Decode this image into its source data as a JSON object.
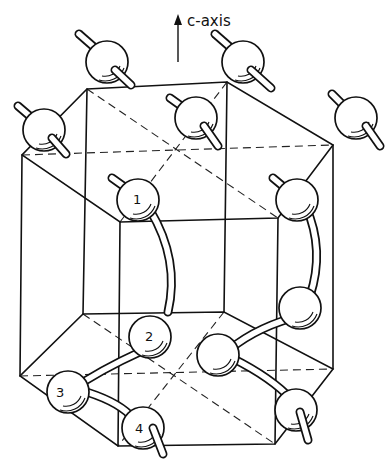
{
  "figure": {
    "type": "crystal-structure-diagram",
    "axis_label": "c-axis",
    "atom_labels": [
      "1",
      "2",
      "3",
      "4"
    ],
    "colors": {
      "line": "#111111",
      "background": "#ffffff"
    }
  }
}
